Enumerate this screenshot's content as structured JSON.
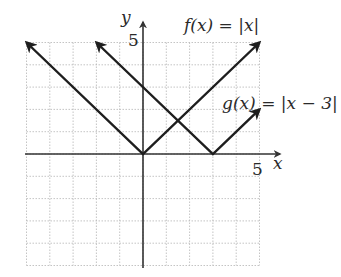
{
  "chart_data": {
    "type": "line",
    "title": "",
    "xlabel": "x",
    "ylabel": "y",
    "xlim": [
      -5,
      5
    ],
    "ylim": [
      -5,
      5
    ],
    "grid": true,
    "x_tick_labels": [
      {
        "value": 5,
        "label": "5"
      }
    ],
    "y_tick_labels": [
      {
        "value": 5,
        "label": "5"
      }
    ],
    "series": [
      {
        "name": "f(x) = |x|",
        "points": [
          [
            -5,
            5
          ],
          [
            0,
            0
          ],
          [
            5,
            5
          ]
        ],
        "arrows": "both"
      },
      {
        "name": "g(x) = |x − 3|",
        "points": [
          [
            -2,
            5
          ],
          [
            3,
            0
          ],
          [
            5,
            2
          ]
        ],
        "arrows": "both"
      }
    ],
    "annotations": [
      {
        "text": "f(x) = |x|",
        "near": [
          4,
          6
        ]
      },
      {
        "text": "g(x) = |x − 3|",
        "near": [
          6,
          3
        ]
      }
    ]
  },
  "labels": {
    "x_axis": "x",
    "y_axis": "y",
    "x_tick_5": "5",
    "y_tick_5": "5",
    "f_label": "f(x) = |x|",
    "g_label": "g(x) = |x − 3|"
  },
  "colors": {
    "line": "#1e1e1e",
    "grid": "#b5b5b5",
    "axis": "#333333"
  }
}
